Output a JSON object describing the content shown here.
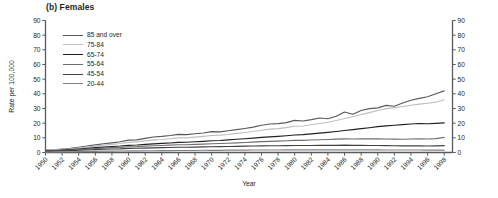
{
  "chart_data": {
    "type": "line",
    "title": "(b) Females",
    "xlabel": "Year",
    "ylabel": "Rate per 100,000",
    "xlim": [
      1950,
      1999
    ],
    "ylim": [
      0,
      90
    ],
    "ytick_step": 10,
    "yticks": [
      0,
      10,
      20,
      30,
      40,
      50,
      60,
      70,
      80,
      90
    ],
    "xticks": [
      1950,
      1952,
      1954,
      1956,
      1958,
      1960,
      1962,
      1964,
      1966,
      1968,
      1970,
      1972,
      1974,
      1976,
      1978,
      1980,
      1982,
      1984,
      1986,
      1988,
      1990,
      1992,
      1994,
      1996,
      1998
    ],
    "right_axis": true,
    "right_yticks": [
      0,
      10,
      20,
      30,
      40,
      50,
      60,
      70,
      80,
      90
    ],
    "grid": false,
    "legend_position": "upper left",
    "x": [
      1950,
      1951,
      1952,
      1953,
      1954,
      1955,
      1956,
      1957,
      1958,
      1959,
      1960,
      1961,
      1962,
      1963,
      1964,
      1965,
      1966,
      1967,
      1968,
      1969,
      1970,
      1971,
      1972,
      1973,
      1974,
      1975,
      1976,
      1977,
      1978,
      1979,
      1980,
      1981,
      1982,
      1983,
      1984,
      1985,
      1986,
      1987,
      1988,
      1989,
      1990,
      1991,
      1992,
      1993,
      1994,
      1995,
      1996,
      1997,
      1998
    ],
    "series": [
      {
        "name": "85 and over",
        "color": "#58595b",
        "values": [
          1.6,
          1.9,
          2.3,
          2.8,
          3.6,
          4.4,
          5.2,
          6.0,
          6.6,
          7.3,
          8.4,
          8.6,
          9.6,
          10.6,
          11.0,
          11.6,
          12.4,
          12.2,
          12.8,
          13.3,
          14.2,
          14.1,
          14.8,
          15.6,
          16.4,
          17.3,
          18.6,
          19.4,
          19.7,
          20.4,
          21.9,
          21.5,
          22.4,
          23.5,
          23.0,
          24.7,
          27.6,
          26.1,
          28.6,
          29.9,
          30.4,
          32.1,
          31.5,
          33.8,
          35.6,
          36.9,
          38.0,
          40.1,
          42.0
        ]
      },
      {
        "name": "75-84",
        "color": "#bcbec0",
        "values": [
          1.5,
          1.8,
          2.1,
          2.5,
          3.1,
          3.7,
          4.3,
          5.0,
          5.5,
          6.1,
          6.9,
          7.2,
          7.9,
          8.6,
          8.9,
          9.4,
          10.0,
          10.0,
          10.5,
          11.0,
          11.6,
          11.8,
          12.3,
          13.0,
          13.6,
          14.3,
          15.2,
          15.9,
          16.3,
          17.0,
          17.9,
          18.1,
          18.9,
          19.8,
          20.6,
          21.8,
          23.2,
          24.4,
          25.9,
          27.2,
          28.6,
          29.9,
          30.6,
          31.4,
          32.2,
          33.0,
          33.6,
          34.3,
          36.0
        ]
      },
      {
        "name": "65-74",
        "color": "#231f20",
        "values": [
          1.2,
          1.4,
          1.7,
          2.0,
          2.4,
          2.8,
          3.3,
          3.7,
          4.1,
          4.4,
          4.9,
          5.1,
          5.5,
          5.9,
          6.2,
          6.5,
          6.9,
          7.0,
          7.3,
          7.6,
          8.0,
          8.2,
          8.6,
          9.0,
          9.4,
          9.8,
          10.3,
          10.7,
          11.0,
          11.4,
          11.9,
          12.2,
          12.7,
          13.2,
          13.7,
          14.3,
          15.0,
          15.6,
          16.3,
          16.9,
          17.6,
          18.2,
          18.6,
          19.0,
          19.4,
          19.8,
          19.6,
          19.9,
          20.2
        ]
      },
      {
        "name": "55-64",
        "color": "#6d6e71",
        "values": [
          1.0,
          1.2,
          1.4,
          1.7,
          2.0,
          2.3,
          2.7,
          3.0,
          3.3,
          3.5,
          3.9,
          4.0,
          4.3,
          4.6,
          4.8,
          5.0,
          5.3,
          5.3,
          5.5,
          5.7,
          6.0,
          6.1,
          6.3,
          6.6,
          6.8,
          7.1,
          7.4,
          7.6,
          7.8,
          8.0,
          8.3,
          8.3,
          8.5,
          8.7,
          8.9,
          9.1,
          9.3,
          9.2,
          9.4,
          9.3,
          9.4,
          9.2,
          9.1,
          9.0,
          9.2,
          9.4,
          9.2,
          9.5,
          10.3
        ]
      },
      {
        "name": "45-54",
        "color": "#414042",
        "values": [
          0.8,
          0.9,
          1.1,
          1.3,
          1.5,
          1.7,
          2.0,
          2.2,
          2.4,
          2.5,
          2.8,
          2.9,
          3.0,
          3.2,
          3.3,
          3.4,
          3.6,
          3.6,
          3.7,
          3.8,
          3.9,
          4.0,
          4.1,
          4.2,
          4.3,
          4.4,
          4.5,
          4.6,
          4.6,
          4.7,
          4.8,
          4.8,
          4.8,
          4.9,
          4.9,
          4.9,
          5.0,
          4.9,
          4.9,
          4.8,
          4.8,
          4.7,
          4.6,
          4.5,
          4.5,
          4.5,
          4.4,
          4.5,
          4.7
        ]
      },
      {
        "name": "20-44",
        "color": "#808285",
        "values": [
          0.3,
          0.4,
          0.4,
          0.5,
          0.6,
          0.7,
          0.8,
          0.9,
          0.9,
          1.0,
          1.1,
          1.1,
          1.2,
          1.2,
          1.3,
          1.3,
          1.4,
          1.4,
          1.4,
          1.5,
          1.5,
          1.5,
          1.6,
          1.6,
          1.6,
          1.7,
          1.7,
          1.7,
          1.7,
          1.8,
          1.8,
          1.8,
          1.8,
          1.8,
          1.8,
          1.8,
          1.8,
          1.8,
          1.8,
          1.8,
          1.8,
          1.7,
          1.7,
          1.7,
          1.7,
          1.7,
          1.6,
          1.6,
          1.6
        ]
      }
    ]
  }
}
